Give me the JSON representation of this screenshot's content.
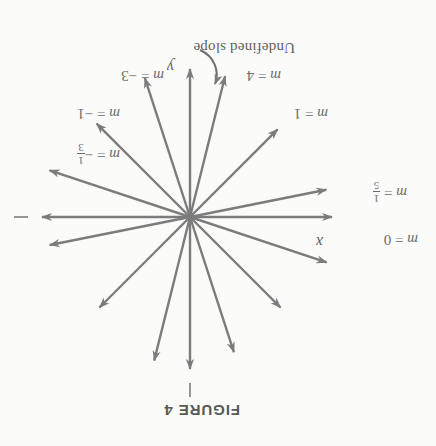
{
  "figure": {
    "caption": "FIGURE 4",
    "caption_position": {
      "x": 196,
      "y": 27
    },
    "page_background": "#fbfbf9",
    "ink_color": "#7c7c7c",
    "text_color": "#6b6b6b",
    "rotated_180": true
  },
  "axes": {
    "origin": {
      "x": 246,
      "y": 229
    },
    "x_axis_label": "x",
    "y_axis_label": "y",
    "x_label_position": {
      "x": 113,
      "y": 196
    },
    "y_label_position": {
      "x": 262,
      "y": 371
    }
  },
  "annotations": {
    "undefined_slope": "Undefined slope",
    "undefined_slope_position": {
      "x": 141,
      "y": 391
    }
  },
  "chart_data": {
    "type": "line",
    "title": "FIGURE 4",
    "xlabel": "x",
    "ylabel": "y",
    "grid": false,
    "legend": "none",
    "xlim": [
      -1,
      1
    ],
    "ylim": [
      -1,
      1
    ],
    "series": [
      {
        "name": "m = 0",
        "slope_text": "0",
        "slope_value": 0,
        "label_parts": {
          "lhs": "m",
          "eq": "=",
          "rhs": "0",
          "fraction": null,
          "negative": false
        },
        "label_position": {
          "x": 18,
          "y": 199
        },
        "angle_deg": 0,
        "ray_length": 148,
        "ray_length_opposite": 142,
        "double_ended": true,
        "tail_tick": true
      },
      {
        "name": "m = 1/5",
        "slope_text": "1/5",
        "slope_value": 0.2,
        "label_parts": {
          "lhs": "m",
          "eq": "=",
          "rhs": "",
          "fraction": {
            "num": "1",
            "den": "5"
          },
          "negative": false
        },
        "label_position": {
          "x": 29,
          "y": 243
        },
        "angle_deg": 11.3,
        "ray_length": 143,
        "ray_length_opposite": 139,
        "double_ended": true,
        "tail_tick": false
      },
      {
        "name": "m = 1",
        "slope_text": "1",
        "slope_value": 1,
        "label_parts": {
          "lhs": "m",
          "eq": "=",
          "rhs": "1",
          "fraction": null,
          "negative": false
        },
        "label_position": {
          "x": 108,
          "y": 325
        },
        "angle_deg": 45,
        "ray_length": 128,
        "ray_length_opposite": 124,
        "double_ended": true,
        "tail_tick": false
      },
      {
        "name": "m = 4",
        "slope_text": "4",
        "slope_value": 4,
        "label_parts": {
          "lhs": "m",
          "eq": "=",
          "rhs": "4",
          "fraction": null,
          "negative": false
        },
        "label_position": {
          "x": 155,
          "y": 363
        },
        "angle_deg": 76,
        "ray_length": 148,
        "ray_length_opposite": 145,
        "double_ended": true,
        "tail_tick": false
      },
      {
        "name": "undefined slope",
        "slope_text": "undefined",
        "slope_value": null,
        "label_parts": null,
        "label_position": null,
        "angle_deg": 90,
        "ray_length": 152,
        "ray_length_opposite": 148,
        "double_ended": true,
        "tail_tick": true
      },
      {
        "name": "m = -3",
        "slope_text": "-3",
        "slope_value": -3,
        "label_parts": {
          "lhs": "m",
          "eq": "=",
          "rhs": "3",
          "fraction": null,
          "negative": true
        },
        "label_position": {
          "x": 272,
          "y": 363
        },
        "angle_deg": -72,
        "ray_length": 146,
        "ray_length_opposite": 142,
        "double_ended": true,
        "tail_tick": false
      },
      {
        "name": "m = -1",
        "slope_text": "-1",
        "slope_value": -1,
        "label_parts": {
          "lhs": "m",
          "eq": "=",
          "rhs": "1",
          "fraction": null,
          "negative": true
        },
        "label_position": {
          "x": 316,
          "y": 325
        },
        "angle_deg": -45,
        "ray_length": 132,
        "ray_length_opposite": 128,
        "double_ended": true,
        "tail_tick": false
      },
      {
        "name": "m = -1/3",
        "slope_text": "-1/3",
        "slope_value": -0.3333,
        "label_parts": {
          "lhs": "m",
          "eq": "=",
          "rhs": "",
          "fraction": {
            "num": "1",
            "den": "3"
          },
          "negative": true
        },
        "label_position": {
          "x": 316,
          "y": 281
        },
        "angle_deg": -18.4,
        "ray_length": 148,
        "ray_length_opposite": 144,
        "double_ended": true,
        "tail_tick": false
      }
    ]
  }
}
